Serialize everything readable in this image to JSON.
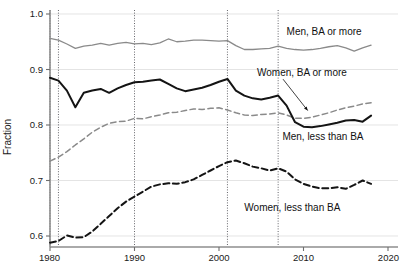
{
  "chart_data": {
    "type": "line",
    "title": "",
    "xlabel": "",
    "ylabel": "Fraction",
    "xlim": [
      1980,
      2020
    ],
    "ylim": [
      0.57,
      1.0
    ],
    "grid": true,
    "legend_position": "inline-annotations",
    "x_ticks": [
      "1980",
      "1990",
      "2000",
      "2010",
      "2020"
    ],
    "x_tick_values": [
      1980,
      1990,
      2000,
      2010,
      2020
    ],
    "y_ticks": [
      "0.6",
      "0.7",
      "0.8",
      "0.9",
      "1.0"
    ],
    "y_tick_values": [
      0.6,
      0.7,
      0.8,
      0.9,
      1.0
    ],
    "recession_lines": [
      1980,
      1981,
      1990,
      2001,
      2007
    ],
    "x": [
      1980,
      1981,
      1982,
      1983,
      1984,
      1985,
      1986,
      1987,
      1988,
      1989,
      1990,
      1991,
      1992,
      1993,
      1994,
      1995,
      1996,
      1997,
      1998,
      1999,
      2000,
      2001,
      2002,
      2003,
      2004,
      2005,
      2006,
      2007,
      2008,
      2009,
      2010,
      2011,
      2012,
      2013,
      2014,
      2015,
      2016,
      2017,
      2018
    ],
    "series": [
      {
        "name": "Men, BA or more",
        "style": "solid",
        "color": "#8a8a8a",
        "width": 1.3,
        "values": [
          0.956,
          0.953,
          0.946,
          0.938,
          0.942,
          0.944,
          0.947,
          0.944,
          0.947,
          0.949,
          0.946,
          0.947,
          0.945,
          0.948,
          0.955,
          0.95,
          0.951,
          0.953,
          0.953,
          0.952,
          0.951,
          0.952,
          0.943,
          0.936,
          0.936,
          0.937,
          0.938,
          0.942,
          0.938,
          0.936,
          0.935,
          0.936,
          0.938,
          0.941,
          0.943,
          0.939,
          0.933,
          0.939,
          0.944
        ]
      },
      {
        "name": "Women, BA or more",
        "style": "dashed",
        "color": "#8a8a8a",
        "width": 1.5,
        "values": [
          0.735,
          0.742,
          0.752,
          0.764,
          0.775,
          0.787,
          0.796,
          0.803,
          0.806,
          0.807,
          0.812,
          0.811,
          0.815,
          0.818,
          0.822,
          0.823,
          0.826,
          0.829,
          0.828,
          0.83,
          0.831,
          0.827,
          0.822,
          0.818,
          0.817,
          0.819,
          0.82,
          0.822,
          0.818,
          0.812,
          0.812,
          0.814,
          0.818,
          0.822,
          0.827,
          0.831,
          0.834,
          0.838,
          0.84
        ]
      },
      {
        "name": "Men, less than BA",
        "style": "solid",
        "color": "#141414",
        "width": 2.0,
        "values": [
          0.885,
          0.88,
          0.862,
          0.832,
          0.858,
          0.862,
          0.865,
          0.858,
          0.866,
          0.872,
          0.877,
          0.878,
          0.88,
          0.882,
          0.874,
          0.866,
          0.861,
          0.864,
          0.867,
          0.872,
          0.878,
          0.883,
          0.862,
          0.853,
          0.848,
          0.846,
          0.849,
          0.853,
          0.835,
          0.805,
          0.797,
          0.796,
          0.798,
          0.801,
          0.804,
          0.808,
          0.809,
          0.806,
          0.817
        ]
      },
      {
        "name": "Women, less than BA",
        "style": "dashed",
        "color": "#141414",
        "width": 2.0,
        "values": [
          0.588,
          0.591,
          0.601,
          0.597,
          0.598,
          0.608,
          0.622,
          0.636,
          0.65,
          0.662,
          0.671,
          0.68,
          0.689,
          0.693,
          0.695,
          0.694,
          0.697,
          0.702,
          0.71,
          0.718,
          0.726,
          0.733,
          0.736,
          0.731,
          0.725,
          0.722,
          0.718,
          0.722,
          0.716,
          0.702,
          0.694,
          0.689,
          0.686,
          0.686,
          0.688,
          0.685,
          0.692,
          0.7,
          0.694
        ]
      }
    ],
    "annotations": [
      {
        "text": "Men, BA or more",
        "x": 2008.0,
        "y": 0.962,
        "anchor": "start",
        "leader": false
      },
      {
        "text": "Women, BA or more",
        "x": 2004.5,
        "y": 0.888,
        "anchor": "start",
        "leader": true,
        "leader_to_x": 2010.5,
        "leader_to_y": 0.826
      },
      {
        "text": "Men, less than BA",
        "x": 2007.5,
        "y": 0.773,
        "anchor": "start",
        "leader": false
      },
      {
        "text": "Women, less than BA",
        "x": 2003.0,
        "y": 0.645,
        "anchor": "start",
        "leader": false
      }
    ]
  },
  "axis": {
    "y_title": "Fraction"
  }
}
